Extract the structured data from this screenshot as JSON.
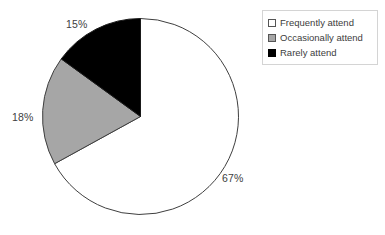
{
  "chart_data": {
    "type": "pie",
    "title": "",
    "categories": [
      "Frequently attend",
      "Occasionally attend",
      "Rarely attend"
    ],
    "values": [
      67,
      18,
      15
    ],
    "value_labels": [
      "67%",
      "18%",
      "15%"
    ],
    "unit": "percent",
    "start_angle_deg": 0,
    "direction": "clockwise",
    "slice_colors": [
      "#ffffff",
      "#a6a6a6",
      "#000000"
    ],
    "slice_outline_color": "#3f3f3f",
    "legend_position": "top-right",
    "grid": false,
    "xlabel": "",
    "ylabel": ""
  },
  "labels": {
    "frequently": "67%",
    "occasionally": "18%",
    "rarely": "15%"
  },
  "legend": {
    "items": [
      {
        "label": "Frequently attend",
        "color": "#ffffff"
      },
      {
        "label": "Occasionally attend",
        "color": "#a6a6a6"
      },
      {
        "label": "Rarely attend",
        "color": "#000000"
      }
    ]
  }
}
